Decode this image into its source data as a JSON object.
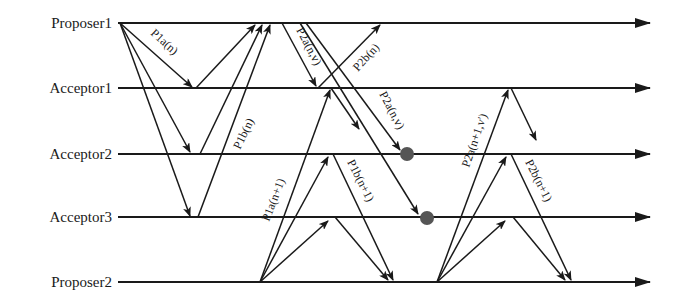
{
  "diagram": {
    "type": "sequence-diagram",
    "topic": "Paxos message flow with two competing proposers",
    "colors": {
      "line": "#1a1a1a",
      "lost_message_dot": "#555555",
      "background": "#ffffff"
    },
    "lanes": [
      {
        "id": "proposer1",
        "label": "Proposer1",
        "y": 23
      },
      {
        "id": "acceptor1",
        "label": "Acceptor1",
        "y": 88
      },
      {
        "id": "acceptor2",
        "label": "Acceptor2",
        "y": 154
      },
      {
        "id": "acceptor3",
        "label": "Acceptor3",
        "y": 217
      },
      {
        "id": "proposer2",
        "label": "Proposer2",
        "y": 282
      }
    ],
    "message_labels": {
      "p1a_n": "P1a(n)",
      "p1b_n": "P1b(n)",
      "p2a_nv_1": "P2a(n,v)",
      "p2b_n": "P2b(n)",
      "p2a_nv_2": "P2a(n,v)",
      "p1a_n1": "P1a(n+1)",
      "p1b_n1": "P1b(n+1)",
      "p2a_n1v": "P2a(n+1,v')",
      "p2b_n1": "P2b(n+1)"
    },
    "messages": [
      {
        "from": "proposer1",
        "to": "acceptor1",
        "label": "P1a(n)"
      },
      {
        "from": "proposer1",
        "to": "acceptor2",
        "label": "P1a(n)"
      },
      {
        "from": "proposer1",
        "to": "acceptor3",
        "label": "P1a(n)"
      },
      {
        "from": "acceptor1",
        "to": "proposer1",
        "label": "P1b(n)"
      },
      {
        "from": "acceptor2",
        "to": "proposer1",
        "label": "P1b(n)"
      },
      {
        "from": "acceptor3",
        "to": "proposer1",
        "label": "P1b(n)"
      },
      {
        "from": "proposer1",
        "to": "acceptor1",
        "label": "P2a(n,v)"
      },
      {
        "from": "acceptor1",
        "to": "proposer1",
        "label": "P2b(n)"
      },
      {
        "from": "proposer1",
        "to": "acceptor2",
        "label": "P2a(n,v)",
        "rejected": true
      },
      {
        "from": "proposer1",
        "to": "acceptor3",
        "label": "P2a(n,v)",
        "rejected": true
      },
      {
        "from": "proposer2",
        "to": "acceptor1",
        "label": "P1a(n+1)"
      },
      {
        "from": "proposer2",
        "to": "acceptor2",
        "label": "P1a(n+1)"
      },
      {
        "from": "proposer2",
        "to": "acceptor3",
        "label": "P1a(n+1)"
      },
      {
        "from": "acceptor1",
        "to": "proposer2",
        "label": "P1b(n+1)",
        "partial": true
      },
      {
        "from": "acceptor2",
        "to": "proposer2",
        "label": "P1b(n+1)"
      },
      {
        "from": "acceptor3",
        "to": "proposer2",
        "label": "P1b(n+1)"
      },
      {
        "from": "proposer2",
        "to": "acceptor1",
        "label": "P2a(n+1,v')"
      },
      {
        "from": "proposer2",
        "to": "acceptor2",
        "label": "P2a(n+1,v')"
      },
      {
        "from": "proposer2",
        "to": "acceptor3",
        "label": "P2a(n+1,v')"
      },
      {
        "from": "acceptor1",
        "to": "proposer2",
        "label": "P2b(n+1)",
        "partial": true
      },
      {
        "from": "acceptor2",
        "to": "proposer2",
        "label": "P2b(n+1)"
      },
      {
        "from": "acceptor3",
        "to": "proposer2",
        "label": "P2b(n+1)"
      }
    ]
  }
}
